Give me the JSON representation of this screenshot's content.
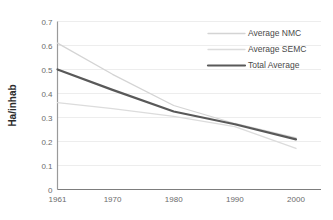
{
  "chart_data": {
    "type": "line",
    "title": "",
    "subtitle": "",
    "xlabel": "",
    "ylabel": "Ha/inhab",
    "xlim": [
      1961,
      2000
    ],
    "ylim": [
      0,
      0.7
    ],
    "grid": true,
    "grid_axis": "y",
    "legend_position": "top-right",
    "x": [
      1961,
      1970,
      1980,
      1990,
      2000
    ],
    "categories": [
      "1961",
      "1970",
      "1980",
      "1990",
      "2000"
    ],
    "xticks": [
      "1961",
      "1970",
      "1980",
      "1990",
      "2000"
    ],
    "yticks": [
      "0",
      "0.1",
      "0.2",
      "0.3",
      "0.4",
      "0.5",
      "0.6",
      "0.7"
    ],
    "ytick_values": [
      0,
      0.1,
      0.2,
      0.3,
      0.4,
      0.5,
      0.6,
      0.7
    ],
    "series": [
      {
        "name": "Average NMC",
        "color": "#d4d4d4",
        "width": 1.3,
        "values": [
          0.61,
          0.48,
          0.35,
          0.275,
          0.215
        ]
      },
      {
        "name": "Average SEMC",
        "color": "#dcdcdc",
        "width": 1.3,
        "values": [
          0.362,
          0.337,
          0.305,
          0.262,
          0.171
        ]
      },
      {
        "name": "Total Average",
        "color": "#595959",
        "width": 2.2,
        "values": [
          0.5,
          0.415,
          0.325,
          0.272,
          0.209
        ]
      }
    ]
  },
  "legend": {
    "items": [
      {
        "label": "Average NMC",
        "color": "#d4d4d4",
        "width": 1.3
      },
      {
        "label": "Average SEMC",
        "color": "#dcdcdc",
        "width": 1.3
      },
      {
        "label": "Total Average",
        "color": "#595959",
        "width": 2.2
      }
    ]
  },
  "axes": {
    "y_title": "Ha/inhab",
    "axis_color": "#9a9a9a",
    "grid_color": "#ededed",
    "tick_label_color": "#6b6b6b"
  }
}
